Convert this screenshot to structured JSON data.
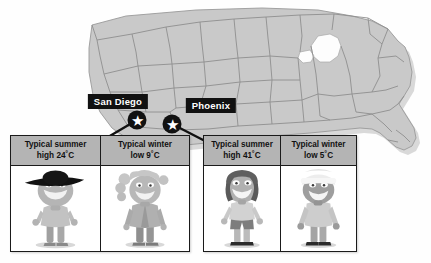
{
  "figure": {
    "background_color": "#ffffff",
    "map": {
      "name": "united-states-map",
      "fill_color": "#c9c9c9",
      "border_color": "#8a8a8a",
      "shadow_color": "#b0b0b0",
      "lakes_color": "#ffffff"
    }
  },
  "cities": [
    {
      "id": "san-diego",
      "label": "San Diego",
      "label_bg": "#111111",
      "label_color": "#ffffff",
      "marker_icon": "star-marker-icon",
      "marker_x": 137,
      "marker_y": 120,
      "label_x": 118,
      "label_y": 110
    },
    {
      "id": "phoenix",
      "label": "Phoenix",
      "label_bg": "#111111",
      "label_color": "#ffffff",
      "marker_icon": "star-marker-icon",
      "marker_x": 172,
      "marker_y": 124,
      "label_x": 196,
      "label_y": 114
    }
  ],
  "panels": [
    {
      "id": "san-diego-panel",
      "city": "San Diego",
      "x": 10,
      "y": 135,
      "width": 180,
      "height": 117,
      "columns": [
        {
          "id": "san-diego-summer",
          "season": "summer",
          "head_line1": "Typical summer",
          "head_line2": "high 24˚C",
          "value": 24,
          "unit": "˚C",
          "figure_name": "character-summer-hat",
          "figure_desc": "cartoon boy wearing a wide-brimmed black sun hat and short-sleeve shirt"
        },
        {
          "id": "san-diego-winter",
          "season": "winter",
          "head_line1": "Typical winter",
          "head_line2": "low 9˚C",
          "value": 9,
          "unit": "˚C",
          "figure_name": "character-winter-jacket",
          "figure_desc": "cartoon girl with curly hair wearing a buttoned jacket and long trousers"
        }
      ]
    },
    {
      "id": "phoenix-panel",
      "city": "Phoenix",
      "x": 203,
      "y": 135,
      "width": 154,
      "height": 117,
      "columns": [
        {
          "id": "phoenix-summer",
          "season": "summer",
          "head_line1": "Typical summer",
          "head_line2": "high 41˚C",
          "value": 41,
          "unit": "˚C",
          "figure_name": "character-summer-shorts",
          "figure_desc": "cartoon child with dark bob hair wearing a t-shirt, shorts and sandals"
        },
        {
          "id": "phoenix-winter",
          "season": "winter",
          "head_line1": "Typical winter",
          "head_line2": "low 5˚C",
          "value": 5,
          "unit": "˚C",
          "figure_name": "character-winter-beanie",
          "figure_desc": "cartoon child wearing a knitted beanie hat, long-sleeve top and trousers"
        }
      ]
    }
  ],
  "connectors": [
    {
      "id": "san-diego-connector",
      "from_x": 137,
      "from_y": 120,
      "to_x": 103,
      "to_y": 137
    },
    {
      "id": "phoenix-connector",
      "from_x": 172,
      "from_y": 124,
      "to_x": 205,
      "to_y": 140
    }
  ]
}
